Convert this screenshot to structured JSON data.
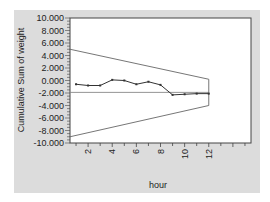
{
  "chart_data": {
    "type": "line",
    "title": "",
    "xlabel": "hour",
    "ylabel": "Cumulative Sum of weight",
    "xlim": [
      0.5,
      15.5
    ],
    "ylim": [
      -10,
      10
    ],
    "x_ticks": [
      2,
      4,
      6,
      8,
      10,
      12
    ],
    "x_tick_labels": [
      "2",
      "4",
      "6",
      "8",
      "10",
      "12"
    ],
    "y_ticks": [
      10,
      8,
      6,
      4,
      2,
      0,
      -2,
      -4,
      -6,
      -8,
      -10
    ],
    "y_tick_labels": [
      "10.000",
      "8.000",
      "6.000",
      "4.000",
      "2.000",
      "0.000",
      "-2.000",
      "-4.000",
      "-6.000",
      "-8.000",
      "-10.000"
    ],
    "grid": false,
    "legend": null,
    "series": [
      {
        "name": "Cumulative Sum of weight",
        "x": [
          1,
          2,
          3,
          4,
          5,
          6,
          7,
          8,
          9,
          10,
          11,
          12
        ],
        "values": [
          -0.6,
          -0.8,
          -0.8,
          0.1,
          0.0,
          -0.6,
          -0.2,
          -0.7,
          -2.3,
          -2.2,
          -2.1,
          -2.1
        ],
        "markers": true,
        "color": "#333333"
      }
    ],
    "reference_line": {
      "name": "center",
      "y": -1.9,
      "x_range": [
        0.5,
        12
      ],
      "color": "#888888"
    },
    "v_mask": {
      "upper": {
        "x": [
          0.5,
          12
        ],
        "y": [
          5.0,
          0.2
        ]
      },
      "lower": {
        "x": [
          0.5,
          12
        ],
        "y": [
          -9.0,
          -4.0
        ]
      },
      "close_x": 12,
      "color": "#666666"
    }
  },
  "colors": {
    "panel_background": "#dcdcdc",
    "plot_background": "#ffffff",
    "axis": "#333333"
  }
}
